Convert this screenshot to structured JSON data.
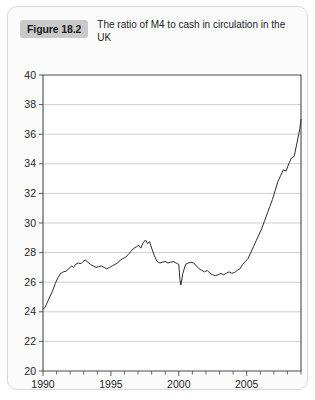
{
  "figure": {
    "badge_label": "Figure 18.2",
    "caption": "The ratio of M4 to cash in circulation in the UK",
    "badge_color": "#c9c9c9",
    "card_background": "#fbfbfb"
  },
  "chart_data": {
    "type": "line",
    "title": "The ratio of M4 to cash in circulation in the UK",
    "xlabel": "",
    "ylabel": "",
    "xlim": [
      1990,
      2009
    ],
    "ylim": [
      20,
      40
    ],
    "y_ticks": [
      20,
      22,
      24,
      26,
      28,
      30,
      32,
      34,
      36,
      38,
      40
    ],
    "y_tick_labels": [
      "20",
      "22",
      "24",
      "26",
      "28",
      "30",
      "32",
      "34",
      "36",
      "38",
      "40"
    ],
    "x_ticks": [
      1990,
      1995,
      2000,
      2005
    ],
    "x_tick_labels": [
      "1990",
      "1995",
      "2000",
      "2005"
    ],
    "x_minor_ticks": [
      1990,
      1991,
      1992,
      1993,
      1994,
      1995,
      1996,
      1997,
      1998,
      1999,
      2000,
      2001,
      2002,
      2003,
      2004,
      2005,
      2006,
      2007,
      2008,
      2009
    ],
    "grid": "horizontal",
    "legend": "none",
    "line_color": "#2b2b2b",
    "series": [
      {
        "name": "M4 to cash ratio",
        "x": [
          1990.0,
          1990.15,
          1990.3,
          1990.5,
          1990.7,
          1990.9,
          1991.1,
          1991.3,
          1991.5,
          1991.7,
          1991.9,
          1992.1,
          1992.25,
          1992.4,
          1992.6,
          1992.8,
          1992.95,
          1993.1,
          1993.3,
          1993.5,
          1993.7,
          1993.9,
          1994.1,
          1994.3,
          1994.5,
          1994.7,
          1994.9,
          1995.1,
          1995.3,
          1995.5,
          1995.7,
          1995.9,
          1996.1,
          1996.3,
          1996.5,
          1996.7,
          1996.9,
          1997.05,
          1997.2,
          1997.4,
          1997.55,
          1997.7,
          1997.85,
          1998.0,
          1998.2,
          1998.4,
          1998.6,
          1998.8,
          1999.0,
          1999.2,
          1999.4,
          1999.6,
          1999.8,
          1999.9,
          2000.0,
          2000.08,
          2000.15,
          2000.3,
          2000.5,
          2000.7,
          2000.9,
          2001.1,
          2001.3,
          2001.5,
          2001.7,
          2001.9,
          2002.1,
          2002.3,
          2002.5,
          2002.7,
          2002.9,
          2003.1,
          2003.3,
          2003.5,
          2003.7,
          2003.9,
          2004.1,
          2004.3,
          2004.5,
          2004.7,
          2004.9,
          2005.1,
          2005.3,
          2005.5,
          2005.7,
          2005.9,
          2006.1,
          2006.3,
          2006.5,
          2006.7,
          2006.9,
          2007.1,
          2007.3,
          2007.5,
          2007.7,
          2007.9,
          2008.1,
          2008.3,
          2008.5,
          2008.7,
          2008.9,
          2009.0
        ],
        "y": [
          24.2,
          24.3,
          24.6,
          25.0,
          25.4,
          25.9,
          26.3,
          26.6,
          26.7,
          26.75,
          26.9,
          27.1,
          27.0,
          27.2,
          27.3,
          27.25,
          27.4,
          27.5,
          27.35,
          27.2,
          27.1,
          27.0,
          27.05,
          27.1,
          27.0,
          26.9,
          27.0,
          27.1,
          27.2,
          27.3,
          27.5,
          27.6,
          27.7,
          27.9,
          28.1,
          28.3,
          28.4,
          28.5,
          28.3,
          28.7,
          28.85,
          28.6,
          28.75,
          28.3,
          27.8,
          27.4,
          27.3,
          27.35,
          27.4,
          27.3,
          27.35,
          27.4,
          27.3,
          27.25,
          27.2,
          26.2,
          25.8,
          26.6,
          27.2,
          27.3,
          27.35,
          27.3,
          27.1,
          26.9,
          26.8,
          26.7,
          26.8,
          26.6,
          26.5,
          26.45,
          26.5,
          26.6,
          26.5,
          26.6,
          26.7,
          26.6,
          26.65,
          26.8,
          26.9,
          27.2,
          27.4,
          27.6,
          28.0,
          28.4,
          28.8,
          29.2,
          29.6,
          30.1,
          30.6,
          31.1,
          31.6,
          32.2,
          32.8,
          33.2,
          33.6,
          33.5,
          34.0,
          34.4,
          34.5,
          35.4,
          36.3,
          37.0
        ]
      }
    ]
  }
}
